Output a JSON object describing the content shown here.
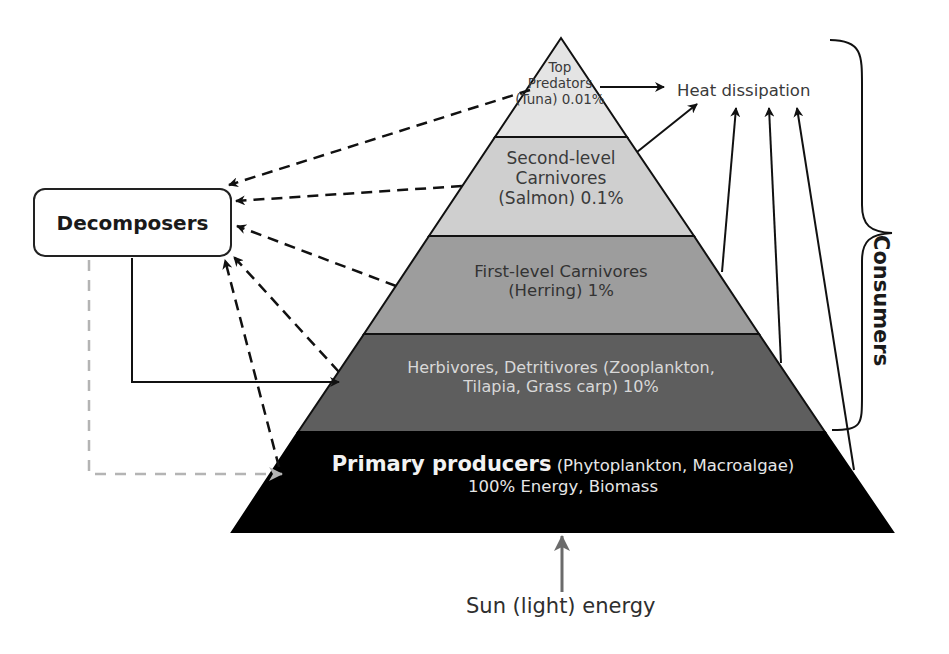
{
  "diagram": {
    "type": "energy-pyramid",
    "levels": [
      {
        "id": "top",
        "line1": "Top",
        "line2": "Predators",
        "line3": "(Tuna) 0.01%",
        "fill": "#e4e4e4"
      },
      {
        "id": "second",
        "line1": "Second-level",
        "line2": "Carnivores",
        "line3": "(Salmon) 0.1%",
        "fill": "#cfcfcf"
      },
      {
        "id": "first",
        "line1": "First-level Carnivores",
        "line2": "(Herring) 1%",
        "fill": "#9d9d9d"
      },
      {
        "id": "herbivores",
        "line1": "Herbivores, Detritivores (Zooplankton,",
        "line2": "Tilapia, Grass carp) 10%",
        "fill": "#5e5e5e"
      },
      {
        "id": "primary",
        "bold": "Primary producers",
        "rest": " (Phytoplankton, Macroalgae)",
        "line2": "100% Energy, Biomass",
        "fill": "#000000"
      }
    ],
    "decomposers": {
      "label": "Decomposers"
    },
    "heat": {
      "label": "Heat dissipation"
    },
    "sun": {
      "label": "Sun (light) energy"
    },
    "consumers": {
      "label": "Consumers"
    }
  }
}
